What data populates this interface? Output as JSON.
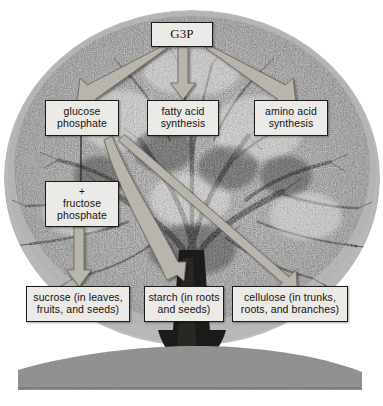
{
  "figure": {
    "background_color": "#ffffff",
    "box_fill_color": "#eceae6",
    "box_border_color": "#1b1b1b",
    "arrow_color": "#b9b5ac",
    "arrow_outline_color": "#6f6b63"
  },
  "nodes": {
    "g3p": {
      "label": "G3P"
    },
    "glucose_phosphate": {
      "line1": "glucose",
      "line2": "phosphate"
    },
    "fatty_acid_synthesis": {
      "line1": "fatty acid",
      "line2": "synthesis"
    },
    "amino_acid_synthesis": {
      "line1": "amino acid",
      "line2": "synthesis"
    },
    "fructose_phosphate": {
      "plus": "+",
      "line1": "fructose",
      "line2": "phosphate"
    },
    "sucrose": {
      "line1": "sucrose (in leaves,",
      "line2": "fruits, and seeds)"
    },
    "starch": {
      "line1": "starch (in roots",
      "line2": "and seeds)"
    },
    "cellulose": {
      "line1": "cellulose (in trunks,",
      "line2": "roots, and branches)"
    }
  },
  "connections": [
    {
      "from": "g3p",
      "to": "glucose_phosphate",
      "style": "arrow-diagonal-left"
    },
    {
      "from": "g3p",
      "to": "fatty_acid_synthesis",
      "style": "arrow-vertical"
    },
    {
      "from": "g3p",
      "to": "amino_acid_synthesis",
      "style": "arrow-diagonal-right"
    },
    {
      "from": "glucose_phosphate",
      "to": "fructose_phosphate",
      "style": "plain-line"
    },
    {
      "from": "glucose_phosphate",
      "to": "starch",
      "style": "arrow-curved"
    },
    {
      "from": "glucose_phosphate",
      "to": "cellulose",
      "style": "arrow-diagonal-right"
    },
    {
      "from": "fructose_phosphate",
      "to": "sucrose",
      "style": "arrow-vertical"
    }
  ],
  "scene": {
    "tree": "deciduous-tree-grayscale",
    "ground": "grass-strip-grayscale"
  }
}
